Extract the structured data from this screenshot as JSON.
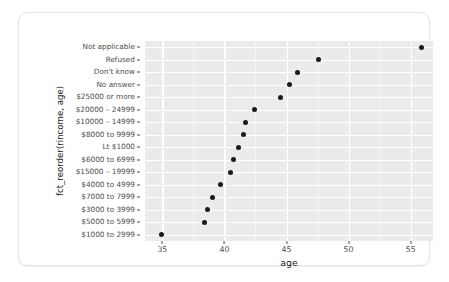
{
  "chart_data": {
    "type": "scatter",
    "title": "",
    "xlabel": "age",
    "ylabel": "fct_reorder(rincome, age)",
    "xlim": [
      33.6,
      56.8
    ],
    "ylim_categories": 16,
    "grid": true,
    "legend": "none",
    "x_ticks": [
      "35",
      "40",
      "45",
      "50",
      "55"
    ],
    "x_tick_values": [
      35,
      40,
      45,
      50,
      55
    ],
    "x_minor_ticks": [
      32.5,
      37.5,
      42.5,
      47.5,
      52.5,
      57.5
    ],
    "categories": [
      "Not applicable",
      "Refused",
      "Don't know",
      "No answer",
      "$25000 or more",
      "$20000 – 24999",
      "$10000 – 14999",
      "$8000 to 9999",
      "Lt $1000",
      "$6000 to 6999",
      "$15000 – 19999",
      "$4000 to 4999",
      "$7000 to 7999",
      "$3000 to 3999",
      "$5000 to 5999",
      "$1000 to 2999"
    ],
    "values": [
      55.9,
      47.6,
      45.9,
      45.2,
      44.5,
      42.4,
      41.7,
      41.5,
      41.1,
      40.7,
      40.5,
      39.7,
      39.0,
      38.6,
      38.4,
      34.9
    ],
    "point_color": "#1a1a1a",
    "panel_color": "#ebebeb",
    "gridline_color": "#ffffff"
  }
}
